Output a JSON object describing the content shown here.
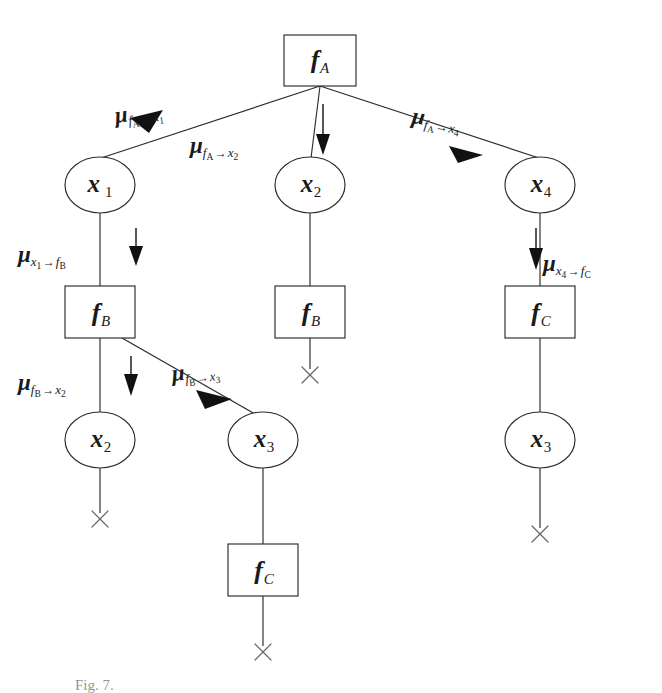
{
  "figure": {
    "type": "factor-graph-message-passing-tree",
    "caption": "Fig. 7.",
    "background_color": "#ffffff",
    "stroke_color": "#1a1a1a"
  },
  "nodes": [
    {
      "id": "fA",
      "kind": "factor",
      "symbol": "f",
      "sub": "A",
      "x": 320,
      "y": 60,
      "w": 72,
      "h": 50
    },
    {
      "id": "x1",
      "kind": "variable",
      "symbol": "x",
      "sub": "1",
      "x": 100,
      "y": 185,
      "rx": 35,
      "ry": 28
    },
    {
      "id": "x2top",
      "kind": "variable",
      "symbol": "x",
      "sub": "2",
      "x": 310,
      "y": 185,
      "rx": 35,
      "ry": 28
    },
    {
      "id": "x4",
      "kind": "variable",
      "symbol": "x",
      "sub": "4",
      "x": 540,
      "y": 185,
      "rx": 35,
      "ry": 28
    },
    {
      "id": "fBl",
      "kind": "factor",
      "symbol": "f",
      "sub": "B",
      "x": 100,
      "y": 312,
      "w": 70,
      "h": 52
    },
    {
      "id": "fBm",
      "kind": "factor",
      "symbol": "f",
      "sub": "B",
      "x": 310,
      "y": 312,
      "w": 70,
      "h": 52
    },
    {
      "id": "fCr",
      "kind": "factor",
      "symbol": "f",
      "sub": "C",
      "x": 540,
      "y": 312,
      "w": 70,
      "h": 52
    },
    {
      "id": "x2bot",
      "kind": "variable",
      "symbol": "x",
      "sub": "2",
      "x": 100,
      "y": 440,
      "rx": 35,
      "ry": 28
    },
    {
      "id": "x3mid",
      "kind": "variable",
      "symbol": "x",
      "sub": "3",
      "x": 263,
      "y": 440,
      "rx": 35,
      "ry": 28
    },
    {
      "id": "x3r",
      "kind": "variable",
      "symbol": "x",
      "sub": "3",
      "x": 540,
      "y": 440,
      "rx": 35,
      "ry": 28
    },
    {
      "id": "fCb",
      "kind": "factor",
      "symbol": "f",
      "sub": "C",
      "x": 263,
      "y": 570,
      "w": 70,
      "h": 52
    }
  ],
  "terminators": [
    {
      "id": "term-fBm",
      "x": 310,
      "y": 375
    },
    {
      "id": "term-x2bot",
      "x": 100,
      "y": 519
    },
    {
      "id": "term-x3r",
      "x": 540,
      "y": 534
    },
    {
      "id": "term-fCb",
      "x": 263,
      "y": 652
    }
  ],
  "messages": [
    {
      "id": "mu-fA-x1",
      "mu": "μ",
      "from": "f",
      "from_sub": "A",
      "to": "x",
      "to_sub": "1",
      "arrow": "→",
      "label_x": 115,
      "label_y": 104,
      "rotate": -8,
      "direction": "down-left"
    },
    {
      "id": "mu-fA-x2",
      "mu": "μ",
      "from": "f",
      "from_sub": "A",
      "to": "x",
      "to_sub": "2",
      "arrow": "→",
      "label_x": 190,
      "label_y": 134,
      "rotate": 0,
      "direction": "down"
    },
    {
      "id": "mu-fA-x4",
      "mu": "μ",
      "from": "f",
      "from_sub": "A",
      "to": "x",
      "to_sub": "4",
      "arrow": "→",
      "label_x": 412,
      "label_y": 104,
      "rotate": 8,
      "direction": "down-right"
    },
    {
      "id": "mu-x1-fB",
      "mu": "μ",
      "from": "x",
      "from_sub": "1",
      "to": "f",
      "to_sub": "B",
      "arrow": "→",
      "label_x": 18,
      "label_y": 243,
      "rotate": 0,
      "direction": "down"
    },
    {
      "id": "mu-x4-fC",
      "mu": "μ",
      "from": "x",
      "from_sub": "4",
      "to": "f",
      "to_sub": "C",
      "arrow": "→",
      "label_x": 543,
      "label_y": 252,
      "rotate": 0,
      "direction": "down"
    },
    {
      "id": "mu-fB-x2",
      "mu": "μ",
      "from": "f",
      "from_sub": "B",
      "to": "x",
      "to_sub": "2",
      "arrow": "→",
      "label_x": 18,
      "label_y": 371,
      "rotate": 0,
      "direction": "down"
    },
    {
      "id": "mu-fB-x3",
      "mu": "μ",
      "from": "f",
      "from_sub": "B",
      "to": "x",
      "to_sub": "3",
      "arrow": "→",
      "label_x": 172,
      "label_y": 362,
      "rotate": -6,
      "direction": "down-right"
    }
  ],
  "edges": [
    {
      "id": "edge-fA-x1",
      "from": "fA",
      "to": "x1"
    },
    {
      "id": "edge-fA-x2top",
      "from": "fA",
      "to": "x2top"
    },
    {
      "id": "edge-fA-x4",
      "from": "fA",
      "to": "x4"
    },
    {
      "id": "edge-x1-fBl",
      "from": "x1",
      "to": "fBl"
    },
    {
      "id": "edge-x2top-fBm",
      "from": "x2top",
      "to": "fBm"
    },
    {
      "id": "edge-x4-fCr",
      "from": "x4",
      "to": "fCr"
    },
    {
      "id": "edge-fBl-x2bot",
      "from": "fBl",
      "to": "x2bot"
    },
    {
      "id": "edge-fBl-x3mid",
      "from": "fBl",
      "to": "x3mid"
    },
    {
      "id": "edge-fCr-x3r",
      "from": "fCr",
      "to": "x3r"
    },
    {
      "id": "edge-x3mid-fCb",
      "from": "x3mid",
      "to": "fCb"
    },
    {
      "id": "edge-fBm-term",
      "from": "fBm",
      "to": "term-fBm"
    },
    {
      "id": "edge-x2bot-term",
      "from": "x2bot",
      "to": "term-x2bot"
    },
    {
      "id": "edge-x3r-term",
      "from": "x3r",
      "to": "term-x3r"
    },
    {
      "id": "edge-fCb-term",
      "from": "fCb",
      "to": "term-fCb"
    }
  ]
}
